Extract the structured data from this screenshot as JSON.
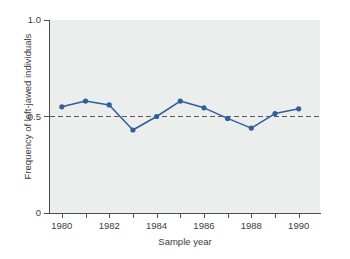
{
  "chart_data": {
    "type": "line",
    "title": "",
    "subtitle": "",
    "xlabel": "Sample year",
    "ylabel": "Frequency of left-jawed individuals",
    "x": [
      1980,
      1981,
      1982,
      1983,
      1984,
      1985,
      1986,
      1987,
      1988,
      1989,
      1990
    ],
    "values": [
      0.55,
      0.58,
      0.56,
      0.43,
      0.5,
      0.58,
      0.545,
      0.49,
      0.44,
      0.515,
      0.54
    ],
    "series": [
      {
        "name": "Frequency of left-jawed individuals",
        "values": [
          0.55,
          0.58,
          0.56,
          0.43,
          0.5,
          0.58,
          0.545,
          0.49,
          0.44,
          0.515,
          0.54
        ],
        "color": "#2f5f9e",
        "marker": "circle"
      }
    ],
    "xlim": [
      1979.5,
      1990.9
    ],
    "ylim": [
      0,
      1.0
    ],
    "grid": false,
    "legend": "none",
    "reference_lines": [
      {
        "name": "equal-frequency-line",
        "orientation": "horizontal",
        "value": 0.5,
        "style": "dashed",
        "color": "#5a5a5a"
      }
    ],
    "y_ticks": [
      {
        "value": 1.0,
        "label": "1.0"
      },
      {
        "value": 0.5,
        "label": "0.5"
      },
      {
        "value": 0.0,
        "label": "0"
      }
    ],
    "y_minor_ticks": [],
    "x_ticks": [
      {
        "value": 1980,
        "label": "1980"
      },
      {
        "value": 1981,
        "label": ""
      },
      {
        "value": 1982,
        "label": "1982"
      },
      {
        "value": 1983,
        "label": ""
      },
      {
        "value": 1984,
        "label": "1984"
      },
      {
        "value": 1985,
        "label": ""
      },
      {
        "value": 1986,
        "label": "1986"
      },
      {
        "value": 1987,
        "label": ""
      },
      {
        "value": 1988,
        "label": "1988"
      },
      {
        "value": 1989,
        "label": ""
      },
      {
        "value": 1990,
        "label": "1990"
      }
    ],
    "plot_background_color": "#eceeed",
    "axis_color": "#4d4d4d"
  }
}
